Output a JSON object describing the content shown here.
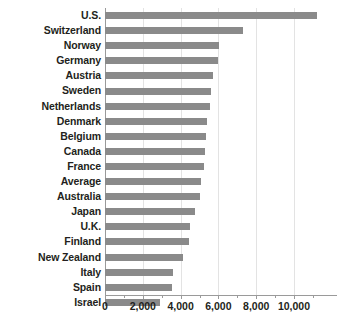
{
  "chart_data": {
    "type": "bar",
    "orientation": "horizontal",
    "title": "",
    "subtitle": "",
    "xlabel": "",
    "ylabel": "",
    "grid": true,
    "legend": false,
    "xlim": [
      0,
      12000
    ],
    "xticks": [
      0,
      2000,
      4000,
      6000,
      8000,
      10000
    ],
    "xtick_labels": [
      "0",
      "2,000",
      "4,000",
      "6,000",
      "8,000",
      "10,000"
    ],
    "bar_color": "#8a8a8a",
    "axis_color": "#9a9a9a",
    "gridline_color": "#e3e3e3",
    "text_color": "#231f20",
    "categories": [
      "U.S.",
      "Switzerland",
      "Norway",
      "Germany",
      "Austria",
      "Sweden",
      "Netherlands",
      "Denmark",
      "Belgium",
      "Canada",
      "France",
      "Average",
      "Australia",
      "Japan",
      "U.K.",
      "Finland",
      "New Zealand",
      "Italy",
      "Spain",
      "Israel"
    ],
    "values": [
      11200,
      7300,
      6050,
      6000,
      5700,
      5600,
      5550,
      5400,
      5350,
      5300,
      5250,
      5100,
      5000,
      4750,
      4500,
      4450,
      4150,
      3600,
      3550,
      2900
    ]
  }
}
